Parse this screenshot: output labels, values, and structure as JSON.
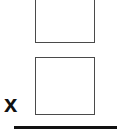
{
  "problem": {
    "type": "vertical-multiplication",
    "operator": "x",
    "top_box": {
      "value": ""
    },
    "bottom_box": {
      "value": ""
    },
    "answer": {
      "value": ""
    }
  },
  "colors": {
    "box_border": "#4a4a4a",
    "text": "#111111",
    "line": "#111111",
    "background": "#ffffff"
  }
}
